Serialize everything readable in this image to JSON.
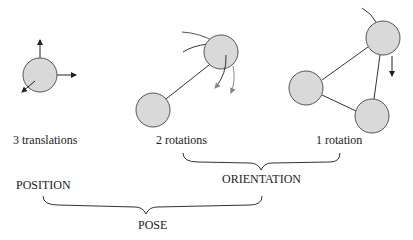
{
  "labels": {
    "translations": "3 translations",
    "two_rotations": "2 rotations",
    "one_rotation": "1 rotation",
    "position": "POSITION",
    "orientation": "ORIENTATION",
    "pose": "POSE"
  },
  "colors": {
    "circle_fill": "#d9d9d9",
    "stroke": "#333333",
    "light_stroke": "#888888"
  }
}
